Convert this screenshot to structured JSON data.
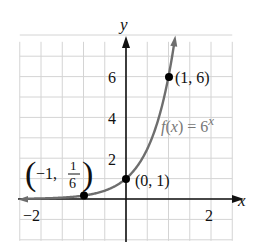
{
  "chart_data": {
    "type": "line",
    "title": "",
    "function_label": "f(x) = 6^x",
    "function_label_parts": {
      "f": "f",
      "open": "(",
      "x": "x",
      "close": ") = 6",
      "exp": "x"
    },
    "xlabel": "x",
    "ylabel": "y",
    "xlim": [
      -2.5,
      2.5
    ],
    "ylim": [
      -2,
      8
    ],
    "x_tick_labels": [
      "−2",
      "2"
    ],
    "x_ticks": [
      -2,
      2
    ],
    "y_tick_labels": [
      "2",
      "4",
      "6"
    ],
    "y_ticks": [
      2,
      4,
      6
    ],
    "grid": true,
    "grid_spacing": {
      "x": 0.5,
      "y": 1
    },
    "series": [
      {
        "name": "f(x) = 6^x",
        "x": [
          -2.5,
          -2,
          -1.5,
          -1,
          -0.5,
          0,
          0.5,
          1,
          1.16
        ],
        "y": [
          0.011,
          0.028,
          0.068,
          0.167,
          0.408,
          1,
          2.449,
          6,
          8
        ],
        "color": "#6e6e6e"
      }
    ],
    "points": [
      {
        "x": -1,
        "y": 0.1667,
        "label_prefix": "−1,",
        "label_num": "1",
        "label_den": "6"
      },
      {
        "x": 0,
        "y": 1,
        "label": "(0, 1)"
      },
      {
        "x": 1,
        "y": 6,
        "label": "(1, 6)"
      }
    ],
    "colors": {
      "curve": "#6e6e6e",
      "axis": "#111111",
      "grid": "#d4d4d4",
      "point": "#000000"
    }
  }
}
